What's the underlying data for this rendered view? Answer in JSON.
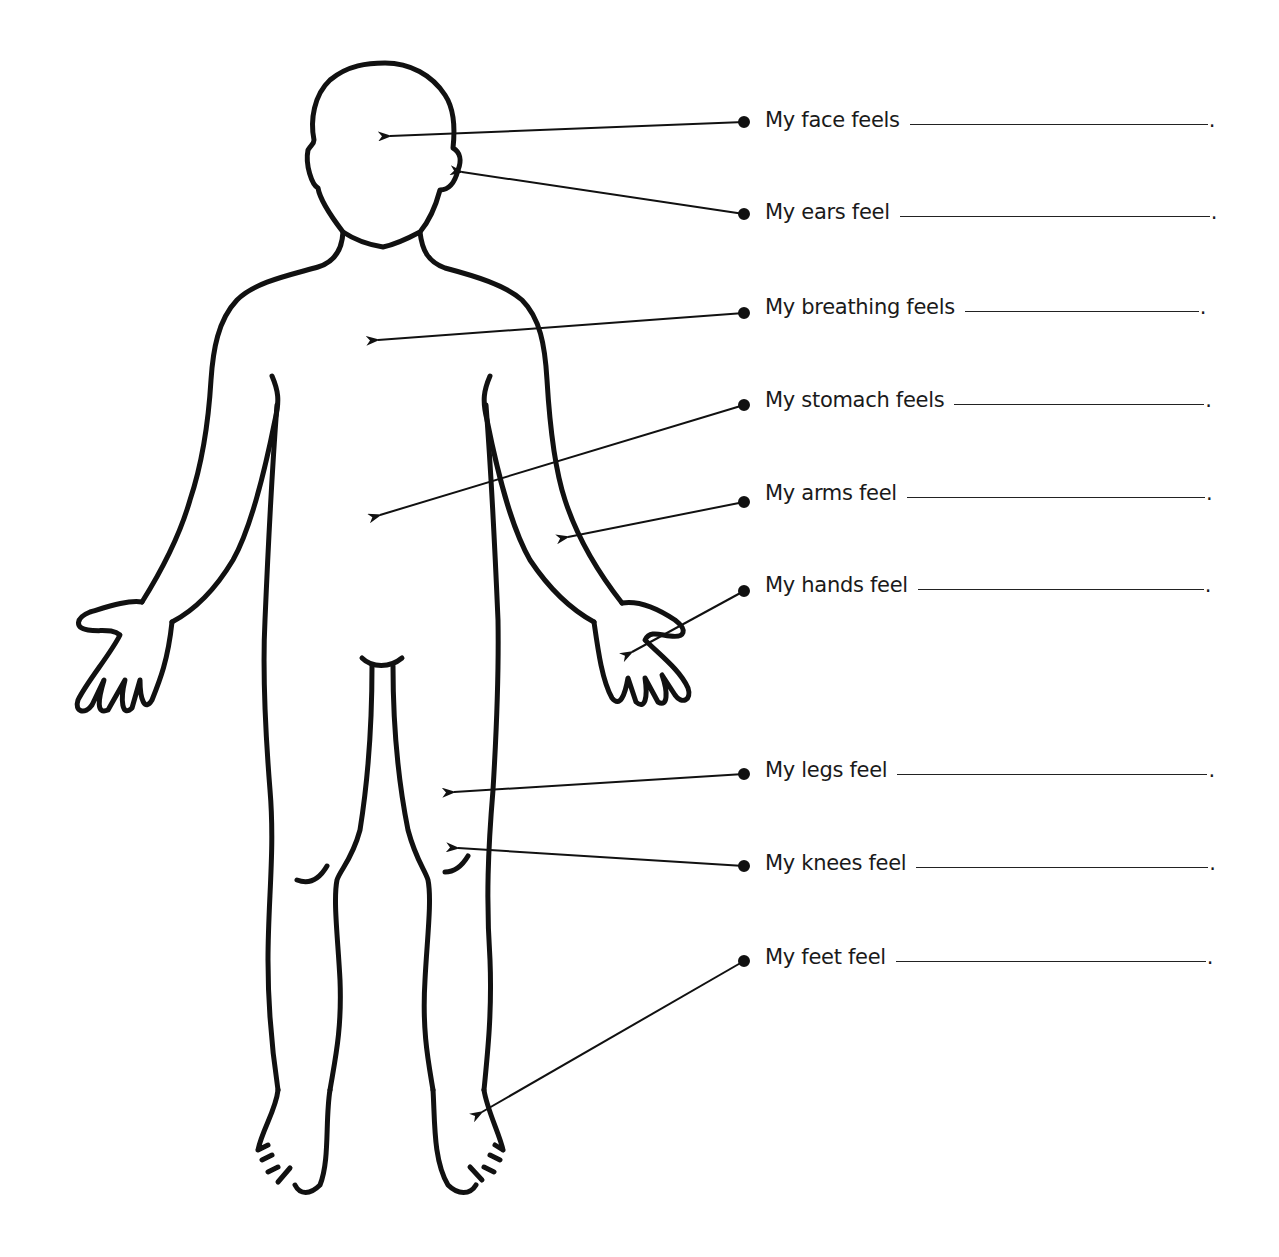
{
  "worksheet": {
    "title": "Body feelings worksheet",
    "labels": [
      {
        "id": "face",
        "text": "My face feels",
        "y": 122,
        "period": "."
      },
      {
        "id": "ears",
        "text": "My ears feel",
        "y": 215,
        "period": "."
      },
      {
        "id": "breathing",
        "text": "My breathing feels",
        "y": 310,
        "period": "."
      },
      {
        "id": "stomach",
        "text": "My stomach feels",
        "y": 403,
        "period": "."
      },
      {
        "id": "arms",
        "text": "My arms feel",
        "y": 496,
        "period": "."
      },
      {
        "id": "hands",
        "text": "My hands feel",
        "y": 588,
        "period": "."
      },
      {
        "id": "legs",
        "text": "My legs feel",
        "y": 773,
        "period": "."
      },
      {
        "id": "knees",
        "text": "My knees feel",
        "y": 866,
        "period": "."
      },
      {
        "id": "feet",
        "text": "My feet feel",
        "y": 960,
        "period": "."
      }
    ],
    "line_color": "#111111"
  }
}
